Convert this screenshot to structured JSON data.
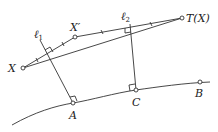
{
  "diagram": {
    "labels": {
      "X": "X",
      "X_prime": "X′",
      "T_X": "T(X)",
      "l1": "ℓ",
      "l1_sub": "1",
      "l2": "ℓ",
      "l2_sub": "2",
      "A": "A",
      "B": "B",
      "C": "C"
    },
    "points": {
      "X": [
        23,
        68
      ],
      "X_prime": [
        75,
        37
      ],
      "T_X": [
        182,
        18
      ],
      "A": [
        73,
        103
      ],
      "C": [
        136,
        90
      ],
      "B": [
        200,
        82
      ]
    },
    "colors": {
      "stroke": "#333333",
      "text": "#222222",
      "background": "#ffffff"
    }
  }
}
